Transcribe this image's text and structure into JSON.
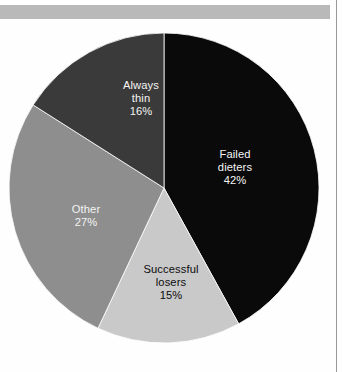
{
  "page": {
    "background_color": "#fefefe",
    "top_rule_color": "#b9b9b9",
    "border_color": "#9a9a9a"
  },
  "chart_data": {
    "type": "pie",
    "title": "",
    "subtitle": "",
    "xlabel": "",
    "ylabel": "",
    "legend_position": "none",
    "grid": false,
    "start_angle_deg": 0,
    "direction": "clockwise",
    "center": {
      "x": 164,
      "y": 188
    },
    "radius": 155,
    "categories": [
      "Failed dieters",
      "Successful losers",
      "Other",
      "Always thin"
    ],
    "values": [
      42,
      15,
      27,
      16
    ],
    "value_suffix": "%",
    "slices": [
      {
        "label": "Failed dieters",
        "label_line1": "Failed",
        "label_line2": "dieters",
        "value": 42,
        "value_text": "42%",
        "color": "#0a0a0a",
        "text_color": "#f4f4f4",
        "start_deg": 0,
        "end_deg": 151.2
      },
      {
        "label": "Successful losers",
        "label_line1": "Successful",
        "label_line2": "losers",
        "value": 15,
        "value_text": "15%",
        "color": "#c9c9c9",
        "text_color": "#0d0d0d",
        "start_deg": 151.2,
        "end_deg": 205.2
      },
      {
        "label": "Other",
        "label_line1": "Other",
        "label_line2": "",
        "value": 27,
        "value_text": "27%",
        "color": "#8e8e8e",
        "text_color": "#f4f4f4",
        "start_deg": 205.2,
        "end_deg": 302.4
      },
      {
        "label": "Always thin",
        "label_line1": "Always",
        "label_line2": "thin",
        "value": 16,
        "value_text": "16%",
        "color": "#3a3a3a",
        "text_color": "#f4f4f4",
        "start_deg": 302.4,
        "end_deg": 360
      }
    ]
  }
}
